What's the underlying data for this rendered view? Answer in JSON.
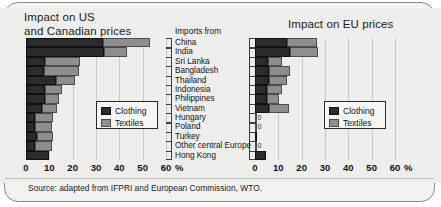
{
  "chart_data": {
    "type": "bar",
    "orientation": "horizontal",
    "stacked": true,
    "xlabel": "%",
    "ylabel": "Imports from",
    "xlim": [
      0,
      60
    ],
    "xticks": [
      0,
      10,
      20,
      30,
      40,
      50,
      60
    ],
    "grid": true,
    "legend_position": "center-right",
    "categories": [
      "China",
      "India",
      "Sri Lanka",
      "Bangladesh",
      "Thailand",
      "Indonesia",
      "Philippines",
      "Vietnam",
      "Hungary",
      "Poland",
      "Turkey",
      "Other central Europe",
      "Hong Kong"
    ],
    "panels": [
      {
        "name": "us_canada",
        "title_line1": "Impact on US",
        "title_line2": "and Canadian prices",
        "series": [
          {
            "name": "Clothing",
            "color": "#2b2b2b",
            "values": [
              33,
              33.5,
              8,
              7.5,
              13,
              8,
              8,
              7,
              4,
              4,
              4.5,
              4,
              10
            ]
          },
          {
            "name": "Textiles",
            "color": "#8e8e8e",
            "values": [
              20,
              10,
              15,
              15,
              8,
              7.5,
              6,
              6.5,
              7.5,
              7,
              7,
              7,
              0
            ]
          }
        ],
        "totals": [
          53,
          43.5,
          23,
          22.5,
          21,
          15.5,
          14,
          13.5,
          11.5,
          11,
          11.5,
          11,
          10
        ],
        "point_labels": [
          "",
          "",
          "",
          "",
          "",
          "",
          "",
          "",
          "",
          "",
          "",
          "",
          ""
        ]
      },
      {
        "name": "eu",
        "title_line1": "Impact on EU prices",
        "title_line2": "",
        "series": [
          {
            "name": "Clothing",
            "color": "#2b2b2b",
            "values": [
              13.5,
              15,
              5.5,
              6,
              6,
              5,
              5,
              6,
              0,
              0,
              1,
              0,
              4.5
            ]
          },
          {
            "name": "Textiles",
            "color": "#8e8e8e",
            "values": [
              13,
              12,
              6,
              9,
              7.5,
              6.5,
              5.5,
              8.5,
              0,
              0,
              0,
              0,
              0
            ]
          }
        ],
        "totals": [
          26.5,
          27,
          11.5,
          15,
          13.5,
          11.5,
          10.5,
          14.5,
          0,
          0,
          1,
          0,
          4.5
        ],
        "point_labels": [
          "",
          "",
          "",
          "",
          "",
          "",
          "",
          "",
          "0",
          "0",
          "",
          "0",
          ""
        ]
      }
    ],
    "legend": [
      "Clothing",
      "Textiles"
    ],
    "source": "Source: adapted from IFPRI and European Commission, WTO."
  },
  "titles": {
    "left_line1": "Impact on US",
    "left_line2": "and Canadian prices",
    "right": "Impact on EU prices"
  },
  "axis": {
    "imports_header": "Imports from",
    "unit": "%",
    "ticks": [
      "0",
      "10",
      "20",
      "30",
      "40",
      "50",
      "60"
    ]
  },
  "legend": {
    "clothing": "Clothing",
    "textiles": "Textiles"
  },
  "footer": {
    "source": "Source: adapted from IFPRI and European Commission, WTO."
  }
}
